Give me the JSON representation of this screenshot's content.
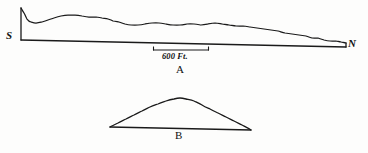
{
  "figure": {
    "background_color": "#fdfdfc",
    "ink_color": "#1a1a1a"
  },
  "panel_a": {
    "caption": "A",
    "left_label": "S",
    "right_label": "N",
    "scale_bar": {
      "label": "600 Ft.",
      "x_start": 153,
      "x_end": 209,
      "y": 50
    },
    "description": "Elongated irregular terrain profile running south to north",
    "baseline": {
      "x_start": 21,
      "y_start": 40,
      "x_end": 346,
      "y_end": 47
    },
    "profile_points": [
      [
        21,
        8
      ],
      [
        24,
        13
      ],
      [
        27,
        19
      ],
      [
        31,
        22
      ],
      [
        36,
        23
      ],
      [
        42,
        22
      ],
      [
        48,
        20
      ],
      [
        54,
        18
      ],
      [
        61,
        16
      ],
      [
        68,
        15
      ],
      [
        75,
        15
      ],
      [
        82,
        16
      ],
      [
        89,
        17
      ],
      [
        96,
        17
      ],
      [
        102,
        18
      ],
      [
        108,
        19
      ],
      [
        113,
        21
      ],
      [
        119,
        22
      ],
      [
        125,
        24
      ],
      [
        131,
        25
      ],
      [
        138,
        25
      ],
      [
        145,
        24
      ],
      [
        152,
        23
      ],
      [
        159,
        23
      ],
      [
        166,
        24
      ],
      [
        173,
        25
      ],
      [
        180,
        25
      ],
      [
        187,
        24
      ],
      [
        194,
        24
      ],
      [
        201,
        25
      ],
      [
        208,
        24
      ],
      [
        215,
        23
      ],
      [
        222,
        24
      ],
      [
        229,
        25
      ],
      [
        236,
        26
      ],
      [
        243,
        26
      ],
      [
        250,
        27
      ],
      [
        257,
        28
      ],
      [
        264,
        29
      ],
      [
        271,
        30
      ],
      [
        278,
        31
      ],
      [
        285,
        33
      ],
      [
        292,
        34
      ],
      [
        299,
        35
      ],
      [
        306,
        36
      ],
      [
        312,
        38
      ],
      [
        318,
        38
      ],
      [
        324,
        40
      ],
      [
        330,
        41
      ],
      [
        336,
        41
      ],
      [
        341,
        42
      ],
      [
        346,
        43
      ]
    ]
  },
  "panel_b": {
    "caption": "B",
    "description": "Symmetric mound cross-section",
    "baseline": {
      "x_start": 110,
      "y_start": 127,
      "x_end": 251,
      "y_end": 130
    },
    "mound_points": [
      [
        110,
        127
      ],
      [
        118,
        123
      ],
      [
        126,
        119
      ],
      [
        134,
        115
      ],
      [
        142,
        111
      ],
      [
        150,
        107
      ],
      [
        158,
        104
      ],
      [
        166,
        101
      ],
      [
        174,
        99
      ],
      [
        180,
        98
      ],
      [
        186,
        99
      ],
      [
        194,
        101
      ],
      [
        202,
        105
      ],
      [
        210,
        109
      ],
      [
        218,
        113
      ],
      [
        226,
        117
      ],
      [
        234,
        121
      ],
      [
        242,
        125
      ],
      [
        251,
        130
      ]
    ]
  }
}
